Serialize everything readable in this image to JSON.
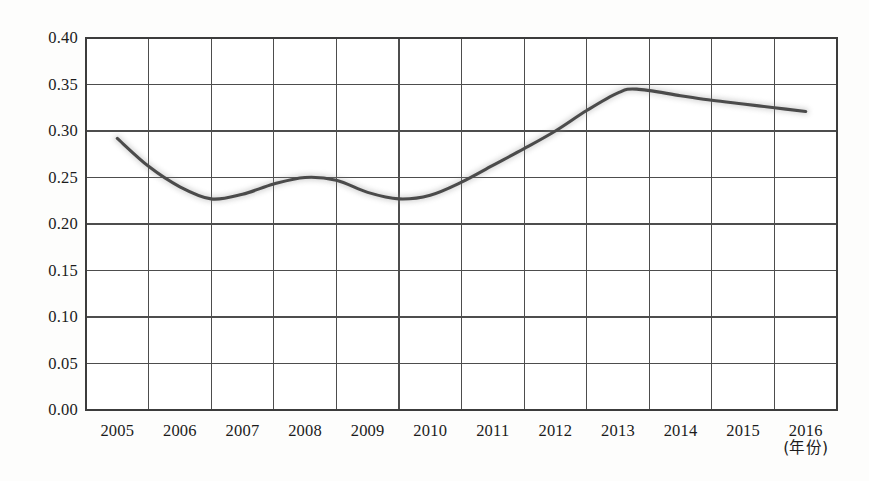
{
  "chart_data": {
    "type": "line",
    "title": "",
    "xlabel": "(年份)",
    "ylabel": "",
    "xlim": [
      2004.5,
      2016.5
    ],
    "ylim": [
      0.0,
      0.4
    ],
    "grid": true,
    "legend": null,
    "line_color": "#4b4b4b",
    "categories": [
      "2005",
      "2006",
      "2007",
      "2008",
      "2009",
      "2010",
      "2011",
      "2012",
      "2013",
      "2014",
      "2015",
      "2016"
    ],
    "x_tick_labels": [
      "2005",
      "2006",
      "2007",
      "2008",
      "2009",
      "2010",
      "2011",
      "2012",
      "2013",
      "2014",
      "2015",
      "2016"
    ],
    "x_axis_unit_label": "(年份)",
    "y_tick_labels": [
      "0.40",
      "0.35",
      "0.30",
      "0.25",
      "0.20",
      "0.15",
      "0.10",
      "0.05",
      "0.00"
    ],
    "y_ticks": [
      0.4,
      0.35,
      0.3,
      0.25,
      0.2,
      0.15,
      0.1,
      0.05,
      0.0
    ],
    "series": [
      {
        "name": "series-1",
        "x": [
          2005.0,
          2005.5,
          2006.0,
          2006.5,
          2007.0,
          2007.5,
          2008.0,
          2008.5,
          2009.0,
          2009.5,
          2010.0,
          2010.5,
          2011.0,
          2011.5,
          2012.0,
          2012.5,
          2013.0,
          2013.3,
          2014.0,
          2014.5,
          2015.0,
          2015.5,
          2016.0
        ],
        "values": [
          0.292,
          0.262,
          0.24,
          0.227,
          0.232,
          0.243,
          0.25,
          0.247,
          0.234,
          0.227,
          0.231,
          0.245,
          0.263,
          0.281,
          0.3,
          0.322,
          0.341,
          0.345,
          0.338,
          0.333,
          0.329,
          0.325,
          0.321
        ]
      }
    ],
    "annotations": []
  },
  "axis": {
    "x_unit": "(年份)"
  }
}
